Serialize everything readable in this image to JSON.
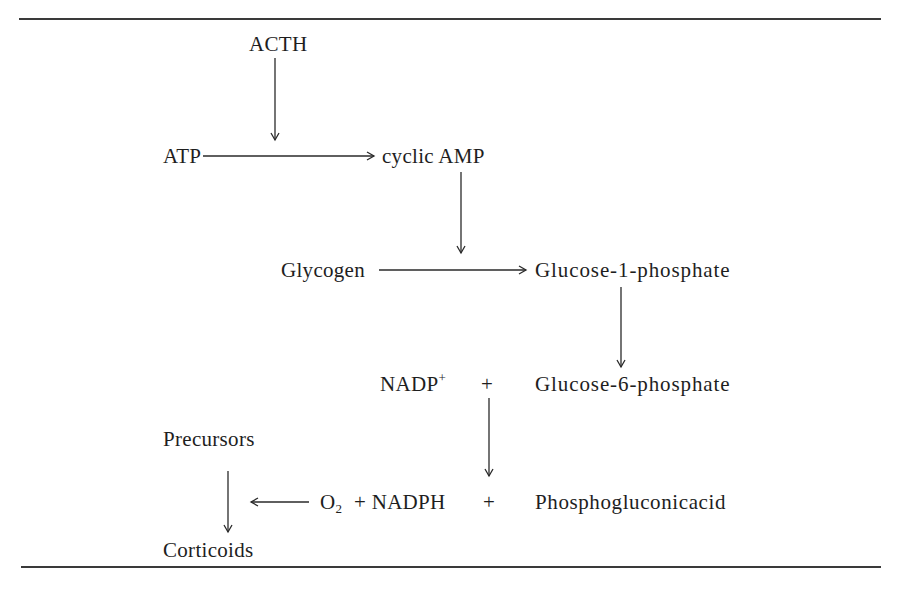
{
  "diagram": {
    "type": "biochemical-pathway",
    "nodes": {
      "acth": "ACTH",
      "atp": "ATP",
      "cyclic_amp": "cyclic AMP",
      "glycogen": "Glycogen",
      "glucose_1_phosphate": "Glucose-1-phosphate",
      "nadp": "NADP",
      "nadp_charge": "+",
      "plus_1": "+",
      "glucose_6_phosphate": "Glucose-6-phosphate",
      "precursors": "Precursors",
      "o2": "O",
      "o2_subscript": "2",
      "plus_nadph": "+ NADPH",
      "plus_2": "+",
      "phosphogluconic_acid": "Phosphogluconicacid",
      "corticoids": "Corticoids"
    },
    "edges": [
      {
        "from": "ACTH",
        "to": "ATP → cyclic AMP",
        "direction": "down"
      },
      {
        "from": "ATP",
        "to": "cyclic AMP",
        "direction": "right"
      },
      {
        "from": "cyclic AMP",
        "to": "Glycogen → Glucose-1-phosphate",
        "direction": "down"
      },
      {
        "from": "Glycogen",
        "to": "Glucose-1-phosphate",
        "direction": "right"
      },
      {
        "from": "Glucose-1-phosphate",
        "to": "Glucose-6-phosphate",
        "direction": "down"
      },
      {
        "from": "NADP+ + Glucose-6-phosphate",
        "to": "O2 + NADPH + Phosphogluconicacid",
        "direction": "down"
      },
      {
        "from": "O2 + NADPH",
        "to": "Precursors → Corticoids",
        "direction": "left"
      },
      {
        "from": "Precursors",
        "to": "Corticoids",
        "direction": "down"
      }
    ]
  }
}
